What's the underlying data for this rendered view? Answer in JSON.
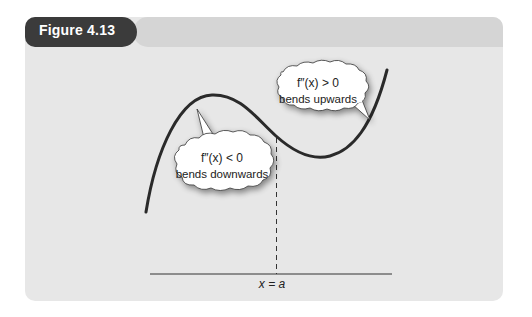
{
  "figure": {
    "label": "Figure 4.13"
  },
  "diagram": {
    "left_bubble": {
      "line1": "f″(x) < 0",
      "line2": "bends downwards"
    },
    "right_bubble": {
      "line1": "f″(x) > 0",
      "line2": "bends upwards"
    },
    "axis_label": "x = a",
    "colors": {
      "panel": "#e7e7e7",
      "header_bar": "#d5d5d5",
      "figure_tag": "#3b3b3b",
      "curve": "#2a2a2a"
    }
  }
}
